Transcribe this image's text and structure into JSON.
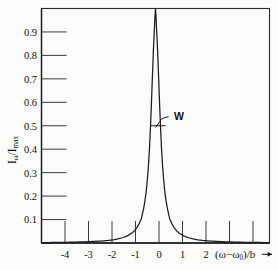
{
  "figure": {
    "background_color": "#fbfbf9",
    "ink_color": "#15161a"
  },
  "chart_data": {
    "type": "line",
    "title": "",
    "subtitle": "",
    "xlabel": "(ω−ω₀)/b",
    "xlabel_parts": {
      "open_paren": "(",
      "omega": "ω",
      "minus": "−",
      "omega0_base": "ω",
      "omega0_sub": "0",
      "close_paren": ")",
      "slash_b": "/b",
      "arrow": "→"
    },
    "ylabel": "Iω/Imax",
    "ylabel_parts": {
      "i_base": "I",
      "i_sub": "ω",
      "slash": "/",
      "i2_base": "I",
      "i2_sub": "max"
    },
    "xlim": [
      -4.85,
      4.85
    ],
    "ylim": [
      0.0,
      1.0
    ],
    "grid": false,
    "legend": false,
    "legend_position": "none",
    "x_tick_values": [
      -4,
      -3,
      -2,
      -1,
      0,
      1,
      2,
      3,
      4
    ],
    "x_tick_labels": [
      "-4",
      "-3",
      "-2",
      "-1",
      "0",
      "1",
      "2",
      "",
      ""
    ],
    "y_tick_values": [
      0.1,
      0.2,
      0.3,
      0.4,
      0.5,
      0.6,
      0.7,
      0.8,
      0.9
    ],
    "y_tick_labels": [
      "0.1",
      "0.2",
      "0.3",
      "0.4",
      "0.5",
      "0.6",
      "0.7",
      "0.8",
      "0.9"
    ],
    "series": [
      {
        "name": "Lorentzian lineshape",
        "formula": "I/Imax = 1 / (1 + (2x/W)^2)",
        "half_width_W": 0.42,
        "x": [
          -4.85,
          -4.6,
          -4.4,
          -4.2,
          -4.0,
          -3.8,
          -3.6,
          -3.4,
          -3.2,
          -3.0,
          -2.8,
          -2.6,
          -2.4,
          -2.2,
          -2.0,
          -1.8,
          -1.6,
          -1.4,
          -1.2,
          -1.0,
          -0.9,
          -0.8,
          -0.7,
          -0.6,
          -0.5,
          -0.45,
          -0.4,
          -0.35,
          -0.3,
          -0.25,
          -0.21,
          -0.17,
          -0.13,
          -0.09,
          -0.05,
          -0.02,
          0.0,
          0.02,
          0.05,
          0.09,
          0.13,
          0.17,
          0.21,
          0.25,
          0.3,
          0.35,
          0.4,
          0.45,
          0.5,
          0.6,
          0.7,
          0.8,
          0.9,
          1.0,
          1.2,
          1.4,
          1.6,
          1.8,
          2.0,
          2.2,
          2.4,
          2.6,
          2.8,
          3.0,
          3.2,
          3.4,
          3.6,
          3.8,
          4.0,
          4.2,
          4.4,
          4.6,
          4.85
        ],
        "y": [
          0.0019,
          0.0021,
          0.0023,
          0.0025,
          0.0028,
          0.0031,
          0.0034,
          0.0038,
          0.0043,
          0.0049,
          0.0056,
          0.0065,
          0.0076,
          0.0091,
          0.011,
          0.0136,
          0.0172,
          0.0224,
          0.0305,
          0.0423,
          0.0517,
          0.0642,
          0.0813,
          0.1047,
          0.1499,
          0.1797,
          0.2161,
          0.2653,
          0.3295,
          0.4136,
          0.5027,
          0.6043,
          0.7133,
          0.8188,
          0.9054,
          0.9686,
          1.0,
          0.9686,
          0.9054,
          0.8188,
          0.7133,
          0.6043,
          0.5027,
          0.4136,
          0.3295,
          0.2653,
          0.2161,
          0.1797,
          0.1499,
          0.1047,
          0.0813,
          0.0642,
          0.0517,
          0.0423,
          0.0305,
          0.0224,
          0.0172,
          0.0136,
          0.011,
          0.0091,
          0.0076,
          0.0065,
          0.0056,
          0.0049,
          0.0043,
          0.0038,
          0.0034,
          0.0031,
          0.0028,
          0.0025,
          0.0023,
          0.0021,
          0.0019
        ]
      }
    ],
    "annotations": [
      {
        "label": "W",
        "meaning": "full-width-at-half-maximum marker",
        "at_y": 0.5,
        "at_x": 0.0
      }
    ]
  }
}
